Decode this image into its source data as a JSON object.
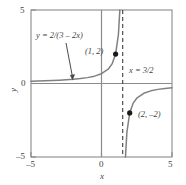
{
  "figure": {
    "name": "rational-function-graph",
    "background_color": "#ffffff",
    "line_color": "#808080",
    "text_color": "#3f3f3f"
  },
  "chart_data": {
    "type": "line",
    "title": "",
    "subtitle": "",
    "xlabel": "x",
    "ylabel": "y",
    "xlim": [
      -5,
      5
    ],
    "ylim": [
      -5,
      5
    ],
    "xticks": [
      -5,
      0,
      5
    ],
    "yticks": [
      -5,
      0,
      5
    ],
    "xtick_labels": [
      "-5",
      "0",
      "5"
    ],
    "ytick_labels": [
      "-5",
      "0",
      "5"
    ],
    "grid": false,
    "legend": "none",
    "series": [
      {
        "name": "y = 2/(3 - 2x)",
        "equation": "y = 2/(3 − 2x)",
        "style": "solid",
        "color": "#808080",
        "branches": [
          {
            "name": "left-branch",
            "domain": [
              -5,
              1.5
            ],
            "points": [
              {
                "x": -5.0,
                "y": 0.1538
              },
              {
                "x": -4.5,
                "y": 0.1667
              },
              {
                "x": -4.0,
                "y": 0.1818
              },
              {
                "x": -3.5,
                "y": 0.2
              },
              {
                "x": -3.0,
                "y": 0.2222
              },
              {
                "x": -2.5,
                "y": 0.25
              },
              {
                "x": -2.0,
                "y": 0.2857
              },
              {
                "x": -1.5,
                "y": 0.3333
              },
              {
                "x": -1.0,
                "y": 0.4
              },
              {
                "x": -0.5,
                "y": 0.5
              },
              {
                "x": 0.0,
                "y": 0.6667
              },
              {
                "x": 0.5,
                "y": 1.0
              },
              {
                "x": 0.75,
                "y": 1.3333
              },
              {
                "x": 1.0,
                "y": 2.0
              },
              {
                "x": 1.2,
                "y": 3.3333
              },
              {
                "x": 1.3,
                "y": 5.0
              }
            ]
          },
          {
            "name": "right-branch",
            "domain": [
              1.5,
              5
            ],
            "points": [
              {
                "x": 1.7,
                "y": -5.0
              },
              {
                "x": 1.8,
                "y": -3.3333
              },
              {
                "x": 2.0,
                "y": -2.0
              },
              {
                "x": 2.25,
                "y": -1.3333
              },
              {
                "x": 2.5,
                "y": -1.0
              },
              {
                "x": 3.0,
                "y": -0.6667
              },
              {
                "x": 3.5,
                "y": -0.5
              },
              {
                "x": 4.0,
                "y": -0.4
              },
              {
                "x": 4.5,
                "y": -0.3333
              },
              {
                "x": 5.0,
                "y": -0.2857
              }
            ]
          }
        ]
      }
    ],
    "asymptotes": [
      {
        "name": "vertical-asymptote",
        "type": "vertical",
        "value": 1.5,
        "label": "x = 3/2",
        "style": "dashed",
        "color": "#3f3f3f"
      }
    ],
    "markers": [
      {
        "name": "point-1-2",
        "x": 1,
        "y": 2,
        "label": "(1, 2)",
        "filled": true
      },
      {
        "name": "point-2-neg2",
        "x": 2,
        "y": -2,
        "label": "(2, −2)",
        "filled": true
      }
    ],
    "annotations": [
      {
        "name": "function-label",
        "text": "y = 2/(3 − 2x)",
        "pointer": {
          "from": [
            -2.6,
            3.4
          ],
          "to": [
            -1.4,
            0.55
          ]
        }
      },
      {
        "name": "asymptote-label",
        "text": "x = 3/2"
      },
      {
        "name": "point-1-label",
        "text": "(1, 2)"
      },
      {
        "name": "point-2-label",
        "text": "(2, −2)"
      }
    ]
  },
  "labels": {
    "x_axis_title": "x",
    "y_axis_title": "y",
    "x_tick_neg5": "–5",
    "x_tick_0": "0",
    "x_tick_5": "5",
    "y_tick_5": "5",
    "y_tick_0": "0",
    "y_tick_neg5": "–5",
    "function_label": "y = 2/(3 – 2x)",
    "asymptote_label": "x = 3/2",
    "point_1_label": "(1, 2)",
    "point_2_label": "(2, –2)"
  }
}
